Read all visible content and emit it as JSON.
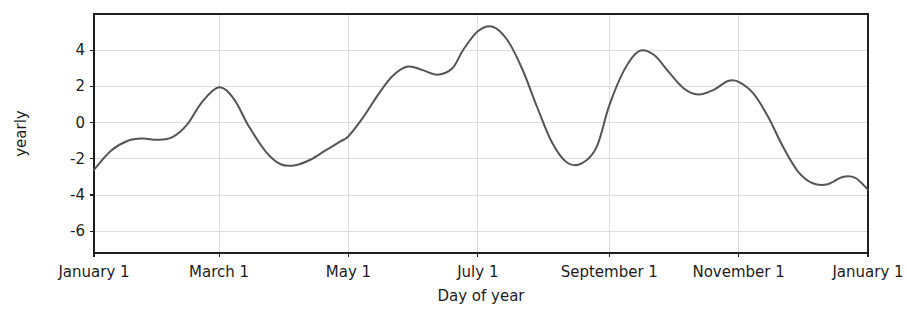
{
  "chart_data": {
    "type": "line",
    "title": "",
    "subtitle": "",
    "xlabel": "Day of year",
    "ylabel": "yearly",
    "grid": true,
    "legend": false,
    "line_color": "#555555",
    "grid_color": "#d8d8d8",
    "frame_color": "#1f1f1f",
    "background_color": "#ffffff",
    "x_tick_labels": [
      "January 1",
      "March 1",
      "May 1",
      "July 1",
      "September 1",
      "November 1",
      "January 1"
    ],
    "x_tick_days": [
      1,
      60,
      121,
      182,
      244,
      305,
      366
    ],
    "xlim": [
      1,
      366
    ],
    "y_tick_labels": [
      "4",
      "2",
      "0",
      "-2",
      "-4",
      "-6"
    ],
    "y_ticks": [
      4,
      2,
      0,
      -2,
      -4,
      -6
    ],
    "ylim": [
      -7.2,
      6.0
    ],
    "series": [
      {
        "name": "yearly",
        "x": [
          1,
          9,
          17,
          24,
          31,
          38,
          45,
          52,
          60,
          67,
          74,
          82,
          89,
          96,
          103,
          110,
          117,
          121,
          128,
          135,
          142,
          149,
          156,
          163,
          170,
          175,
          182,
          189,
          196,
          203,
          210,
          217,
          224,
          231,
          238,
          244,
          251,
          258,
          265,
          272,
          279,
          286,
          293,
          300,
          305,
          312,
          319,
          326,
          333,
          340,
          347,
          354,
          360,
          366
        ],
        "y": [
          -2.6,
          -1.55,
          -1.0,
          -0.88,
          -0.95,
          -0.8,
          -0.1,
          1.15,
          1.95,
          1.3,
          -0.2,
          -1.6,
          -2.3,
          -2.35,
          -2.05,
          -1.55,
          -1.05,
          -0.75,
          0.3,
          1.55,
          2.6,
          3.1,
          2.9,
          2.65,
          3.0,
          4.0,
          5.05,
          5.3,
          4.55,
          2.95,
          0.85,
          -1.1,
          -2.2,
          -2.25,
          -1.35,
          0.95,
          2.9,
          3.95,
          3.75,
          2.8,
          1.9,
          1.55,
          1.8,
          2.3,
          2.25,
          1.6,
          0.3,
          -1.35,
          -2.7,
          -3.35,
          -3.4,
          -3.0,
          -3.05,
          -3.7
        ],
        "x_labels_meaning": "day of year"
      }
    ],
    "annotations": []
  }
}
